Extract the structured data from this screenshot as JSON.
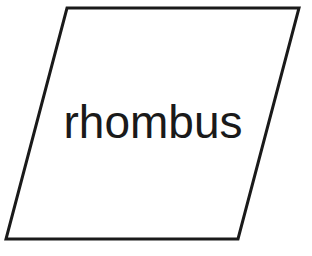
{
  "diagram": {
    "shape": {
      "type": "parallelogram",
      "points": "67,8 299,8 238,239 6,239",
      "stroke": "#1a1a1a",
      "stroke_width": 3,
      "fill": "#ffffff"
    },
    "label": {
      "text": "rhombus",
      "x": 153,
      "y": 138,
      "color": "#1a1a1a"
    }
  }
}
